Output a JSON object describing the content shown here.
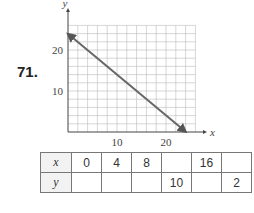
{
  "problem": {
    "number": "71."
  },
  "graph": {
    "x_axis_label": "x",
    "y_axis_label": "y",
    "x_ticks": [
      "10",
      "20"
    ],
    "y_ticks": [
      "10",
      "20"
    ]
  },
  "chart_data": {
    "type": "line",
    "title": "",
    "xlabel": "x",
    "ylabel": "y",
    "xlim": [
      0,
      26
    ],
    "ylim": [
      0,
      26
    ],
    "grid": true,
    "grid_step": 2,
    "x_tick_labels": [
      "10",
      "20"
    ],
    "y_tick_labels": [
      "10",
      "20"
    ],
    "series": [
      {
        "name": "line",
        "x": [
          0,
          24
        ],
        "y": [
          24,
          0
        ],
        "arrows": "both"
      }
    ]
  },
  "table": {
    "x_label": "x",
    "y_label": "y",
    "x_values": [
      "0",
      "4",
      "8",
      "",
      "16",
      ""
    ],
    "y_values": [
      "",
      "",
      "",
      "10",
      "",
      "2"
    ]
  }
}
